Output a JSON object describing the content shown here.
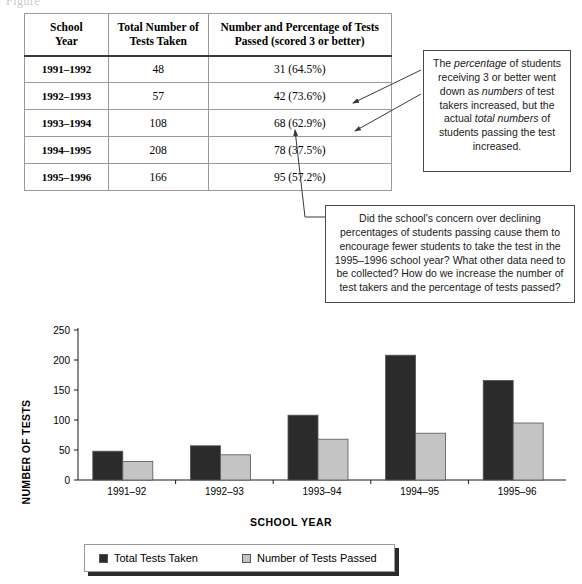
{
  "page": {
    "top_sliver_text": "Figure"
  },
  "table": {
    "headers": [
      "School Year",
      "Total Number of Tests Taken",
      "Number and Percentage of Tests Passed (scored 3 or better)"
    ],
    "header_lines": {
      "col1_line1": "School",
      "col1_line2": "Year",
      "col2_line1": "Total Number of",
      "col2_line2": "Tests Taken",
      "col3_line1": "Number and Percentage of Tests",
      "col3_line2": "Passed (scored 3 or better)"
    },
    "rows": [
      {
        "year": "1991–1992",
        "total_taken": "48",
        "passed": "31 (64.5%)"
      },
      {
        "year": "1992–1993",
        "total_taken": "57",
        "passed": "42 (73.6%)"
      },
      {
        "year": "1993–1994",
        "total_taken": "108",
        "passed": "68 (62.9%)"
      },
      {
        "year": "1994–1995",
        "total_taken": "208",
        "passed": "78 (37.5%)"
      },
      {
        "year": "1995–1996",
        "total_taken": "166",
        "passed": "95 (57.2%)"
      }
    ]
  },
  "callouts": {
    "right": {
      "text": "The percentage of students receiving 3 or better went down as numbers of test takers increased, but the actual total numbers of students passing the test increased.",
      "italic_phrases": [
        "percentage",
        "numbers",
        "total numbers"
      ]
    },
    "bottom": {
      "text": "Did the school's concern over declining percentages of students passing cause them to encourage fewer students to take the test in the 1995–1996 school year? What other data need to be collected? How do we increase the number of test takers and the percentage of tests passed?"
    }
  },
  "chart_data": {
    "type": "bar",
    "title": "",
    "xlabel": "SCHOOL YEAR",
    "ylabel": "NUMBER OF TESTS",
    "categories": [
      "1991–92",
      "1992–93",
      "1993–94",
      "1994–95",
      "1995–96"
    ],
    "series": [
      {
        "name": "Total Tests Taken",
        "values": [
          48,
          57,
          108,
          208,
          166
        ],
        "color": "#2b2b2b"
      },
      {
        "name": "Number of Tests Passed",
        "values": [
          31,
          42,
          68,
          78,
          95
        ],
        "color": "#c4c4c4"
      }
    ],
    "ylim": [
      0,
      250
    ],
    "yticks": [
      0,
      50,
      100,
      150,
      200,
      250
    ],
    "grid": false,
    "legend_position": "bottom"
  },
  "legend": {
    "items": [
      {
        "label": "Total Tests Taken",
        "color": "#2b2b2b"
      },
      {
        "label": "Number of Tests Passed",
        "color": "#c4c4c4"
      }
    ]
  }
}
